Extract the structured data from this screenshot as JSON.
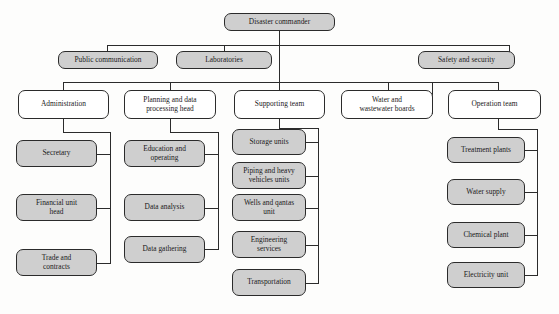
{
  "diagram": {
    "type": "org-chart",
    "colors": {
      "filled_node_fill": "#cfcfcf",
      "plain_node_fill": "#ffffff",
      "node_border": "#2b2b2b",
      "connector": "#2b2b2b",
      "background": "#fdfdfc",
      "text": "#1a1a1a"
    },
    "root": {
      "label": "Disaster commander",
      "style": "filled"
    },
    "level2": [
      {
        "label": "Public communication",
        "style": "filled"
      },
      {
        "label": "Laboratories",
        "style": "filled"
      },
      {
        "label": "Safety and security",
        "style": "filled"
      }
    ],
    "level3": [
      {
        "label": "Administration",
        "style": "plain",
        "children": [
          {
            "label": "Secretary",
            "style": "filled"
          },
          {
            "label": "Financial unit\nhead",
            "style": "filled"
          },
          {
            "label": "Trade and\ncontracts",
            "style": "filled"
          }
        ]
      },
      {
        "label": "Planning and data\nprocessing head",
        "style": "plain",
        "children": [
          {
            "label": "Education and\noperating",
            "style": "filled"
          },
          {
            "label": "Data analysis",
            "style": "filled"
          },
          {
            "label": "Data gathering",
            "style": "filled"
          }
        ]
      },
      {
        "label": "Supporting team",
        "style": "plain",
        "children": [
          {
            "label": "Storage units",
            "style": "filled"
          },
          {
            "label": "Piping and heavy\nvehicles units",
            "style": "filled"
          },
          {
            "label": "Wells and qantas\nunit",
            "style": "filled"
          },
          {
            "label": "Engineering\nservices",
            "style": "filled"
          },
          {
            "label": "Transportation",
            "style": "filled"
          }
        ]
      },
      {
        "label": "Water and\nwastewater boards",
        "style": "plain",
        "children": []
      },
      {
        "label": "Operation team",
        "style": "plain",
        "children": [
          {
            "label": "Treatment plants",
            "style": "filled"
          },
          {
            "label": "Water supply",
            "style": "filled"
          },
          {
            "label": "Chemical plant",
            "style": "filled"
          },
          {
            "label": "Electricity unit",
            "style": "filled"
          }
        ]
      }
    ]
  }
}
